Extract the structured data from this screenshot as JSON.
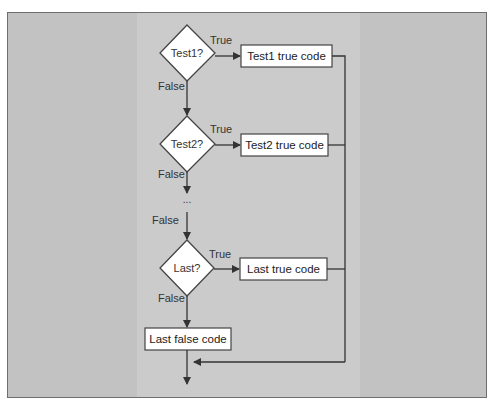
{
  "diagram": {
    "type": "flowchart",
    "title": "",
    "colors": {
      "background": "#c2c2c2",
      "column": "#cbcbcb",
      "shape_fill": "#ffffff",
      "stroke": "#333333"
    },
    "decisions": [
      {
        "id": "d1",
        "label": "Test1?",
        "true_label": "True",
        "false_label": "False"
      },
      {
        "id": "d2",
        "label": "Test2?",
        "true_label": "True",
        "false_label": "False"
      },
      {
        "id": "d3",
        "label": "Last?",
        "true_label": "True",
        "false_label": "False"
      }
    ],
    "process_boxes": [
      {
        "id": "p1",
        "label": "Test1 true code"
      },
      {
        "id": "p2",
        "label": "Test2 true code"
      },
      {
        "id": "p3",
        "label": "Last true code"
      },
      {
        "id": "p4",
        "label": "Last false code"
      }
    ],
    "ellipsis": "...",
    "ellipsis_false_label": "False",
    "edges": [
      {
        "from": "d1",
        "to": "p1",
        "label": "True"
      },
      {
        "from": "d1",
        "to": "d2",
        "label": "False"
      },
      {
        "from": "d2",
        "to": "p2",
        "label": "True"
      },
      {
        "from": "d2",
        "to": "ellipsis",
        "label": "False"
      },
      {
        "from": "ellipsis",
        "to": "d3",
        "label": "False"
      },
      {
        "from": "d3",
        "to": "p3",
        "label": "True"
      },
      {
        "from": "d3",
        "to": "p4",
        "label": "False"
      },
      {
        "from": "p1",
        "to": "merge"
      },
      {
        "from": "p2",
        "to": "merge"
      },
      {
        "from": "p3",
        "to": "merge"
      },
      {
        "from": "p4",
        "to": "exit"
      },
      {
        "from": "merge",
        "to": "exit"
      }
    ]
  }
}
